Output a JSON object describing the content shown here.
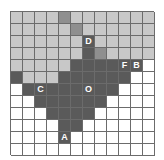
{
  "figure": {
    "name": "hex-grid-diagram",
    "grid": {
      "rows": 12,
      "cols": 12,
      "cell_size_px": 12
    },
    "palette": {
      "white": "#ffffff",
      "light": "#c8c8c8",
      "medium": "#8f8f8f",
      "dark": "#5a5a5a",
      "gridline": "#6b6b6b",
      "label_text": "#ffffff"
    },
    "legend_note": "w = white, l = light gray, m = medium gray, d = dark gray",
    "cells": [
      [
        "l",
        "l",
        "l",
        "l",
        "m",
        "l",
        "l",
        "l",
        "l",
        "l",
        "l",
        "l"
      ],
      [
        "l",
        "l",
        "l",
        "l",
        "l",
        "m",
        "l",
        "l",
        "l",
        "l",
        "l",
        "l"
      ],
      [
        "l",
        "l",
        "l",
        "l",
        "l",
        "l",
        "d",
        "l",
        "l",
        "l",
        "l",
        "l"
      ],
      [
        "l",
        "l",
        "l",
        "l",
        "l",
        "l",
        "d",
        "m",
        "l",
        "l",
        "l",
        "l"
      ],
      [
        "l",
        "l",
        "l",
        "l",
        "l",
        "d",
        "d",
        "d",
        "d",
        "d",
        "d",
        "w"
      ],
      [
        "d",
        "l",
        "l",
        "l",
        "d",
        "d",
        "d",
        "d",
        "d",
        "d",
        "w",
        "w"
      ],
      [
        "w",
        "d",
        "d",
        "d",
        "d",
        "d",
        "d",
        "d",
        "d",
        "w",
        "w",
        "w"
      ],
      [
        "w",
        "w",
        "d",
        "d",
        "d",
        "d",
        "d",
        "d",
        "w",
        "w",
        "w",
        "w"
      ],
      [
        "w",
        "w",
        "w",
        "d",
        "d",
        "d",
        "d",
        "w",
        "w",
        "w",
        "w",
        "w"
      ],
      [
        "w",
        "w",
        "w",
        "w",
        "d",
        "d",
        "w",
        "w",
        "w",
        "w",
        "w",
        "w"
      ],
      [
        "w",
        "w",
        "w",
        "w",
        "d",
        "w",
        "w",
        "w",
        "w",
        "w",
        "w",
        "w"
      ],
      [
        "w",
        "w",
        "w",
        "w",
        "w",
        "w",
        "w",
        "w",
        "w",
        "w",
        "w",
        "w"
      ]
    ],
    "labels": [
      {
        "text": "D",
        "row": 3,
        "col": 7
      },
      {
        "text": "F",
        "row": 5,
        "col": 10
      },
      {
        "text": "B",
        "row": 5,
        "col": 11
      },
      {
        "text": "C",
        "row": 7,
        "col": 3
      },
      {
        "text": "O",
        "row": 7,
        "col": 7
      },
      {
        "text": "A",
        "row": 11,
        "col": 5
      }
    ]
  }
}
